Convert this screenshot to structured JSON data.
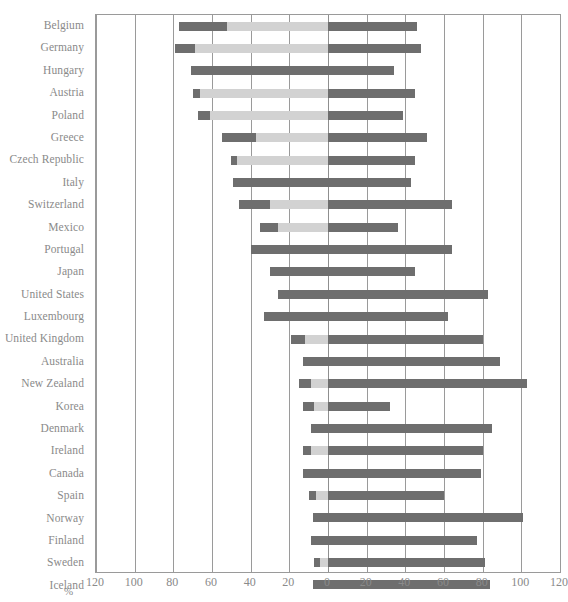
{
  "chart_data": {
    "type": "bar",
    "orientation": "horizontal",
    "subtype": "diverging-stacked",
    "title": "",
    "subtitle": "",
    "xlabel": "%",
    "ylabel": "",
    "xlim": [
      -120,
      120
    ],
    "xtick_labels": [
      "120",
      "100",
      "80",
      "60",
      "40",
      "20",
      "0",
      "20",
      "40",
      "60",
      "80",
      "100",
      "120"
    ],
    "xticks": [
      -120,
      -100,
      -80,
      -60,
      -40,
      -20,
      0,
      20,
      40,
      60,
      80,
      100,
      120
    ],
    "x_axis_note": "Axis is mirrored: magnitude increases outward from 0 in both directions",
    "grid": true,
    "legend": "none",
    "colors": {
      "dark": "#6e6e6e",
      "light": "#d2d2d2",
      "axis": "#9a9a9a",
      "text": "#8a8a8a"
    },
    "categories": [
      "Belgium",
      "Germany",
      "Hungary",
      "Austria",
      "Poland",
      "Greece",
      "Czech Republic",
      "Italy",
      "Switzerland",
      "Mexico",
      "Portugal",
      "Japan",
      "United States",
      "Luxembourg",
      "United Kingdom",
      "Australia",
      "New Zealand",
      "Korea",
      "Denmark",
      "Ireland",
      "Canada",
      "Spain",
      "Norway",
      "Finland",
      "Sweden",
      "Iceland"
    ],
    "series": [
      {
        "name": "left-dark",
        "color": "#6e6e6e",
        "values": [
          77,
          79,
          71,
          70,
          67,
          55,
          50,
          49,
          46,
          35,
          40,
          30,
          26,
          33,
          19,
          13,
          15,
          13,
          9,
          13,
          13,
          10,
          8,
          9,
          7,
          8
        ]
      },
      {
        "name": "left-light",
        "color": "#d2d2d2",
        "values": [
          52,
          69,
          0,
          66,
          61,
          37,
          47,
          0,
          30,
          26,
          0,
          0,
          0,
          0,
          12,
          0,
          9,
          7,
          0,
          9,
          0,
          6,
          0,
          0,
          4,
          0
        ]
      },
      {
        "name": "right-dark",
        "color": "#6e6e6e",
        "values": [
          46,
          48,
          34,
          45,
          39,
          51,
          45,
          43,
          64,
          36,
          64,
          45,
          83,
          62,
          80,
          89,
          103,
          32,
          85,
          80,
          79,
          60,
          101,
          77,
          81,
          84
        ]
      }
    ]
  }
}
